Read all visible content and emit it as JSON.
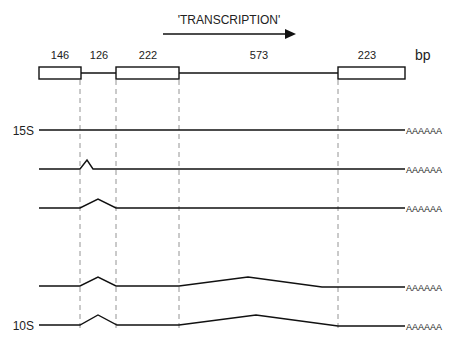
{
  "title": "'TRANSCRIPTION'",
  "unit": "bp",
  "segments": [
    {
      "label": "146",
      "type": "exon"
    },
    {
      "label": "126",
      "type": "intron"
    },
    {
      "label": "222",
      "type": "exon"
    },
    {
      "label": "573",
      "type": "intron"
    },
    {
      "label": "223",
      "type": "exon"
    }
  ],
  "rows": [
    {
      "label": "15S",
      "tail": "AAAAAA"
    },
    {
      "label": "",
      "tail": "AAAAAA"
    },
    {
      "label": "",
      "tail": "AAAAAA"
    },
    {
      "label": "",
      "tail": "AAAAAA"
    },
    {
      "label": "10S",
      "tail": "AAAAAA"
    }
  ],
  "colors": {
    "line": "#111111",
    "dashed": "#888888",
    "text": "#222222"
  }
}
